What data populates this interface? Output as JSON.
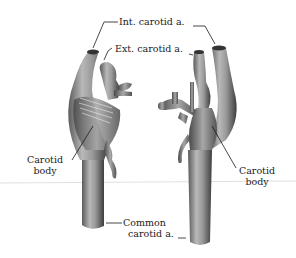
{
  "figure": {
    "type": "anatomical-illustration",
    "labels": {
      "int_carotid": "Int. carotid a.",
      "ext_carotid": "Ext. carotid a.",
      "carotid_body_left_1": "Carotid",
      "carotid_body_left_2": "body",
      "carotid_body_right_1": "Carotid",
      "carotid_body_right_2": "body",
      "common_carotid_1": "Common",
      "common_carotid_2": "carotid a."
    },
    "colors": {
      "background": "#ffffff",
      "vessel_dark": "#4a4a4a",
      "vessel_mid": "#8a8a8a",
      "vessel_light": "#cfcfcf",
      "leader_line": "#1a1a1a",
      "rule_line": "#d8d8d8"
    }
  }
}
